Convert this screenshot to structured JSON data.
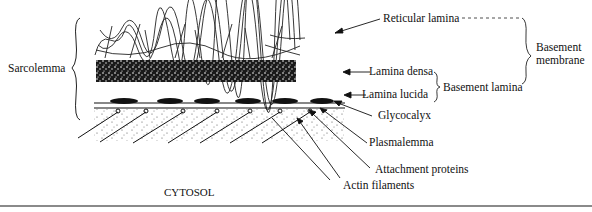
{
  "diagram": {
    "title": "",
    "left_brace_label": "Sarcolemma",
    "layers": [
      {
        "id": "reticular",
        "label": "Reticular lamina"
      },
      {
        "id": "densa",
        "label": "Lamina densa"
      },
      {
        "id": "lucida",
        "label": "Lamina lucida"
      },
      {
        "id": "glycocalyx",
        "label": "Glycocalyx"
      },
      {
        "id": "plasmalemma",
        "label": "Plasmalemma"
      },
      {
        "id": "attachment",
        "label": "Attachment proteins"
      },
      {
        "id": "actin",
        "label": "Actin filaments"
      }
    ],
    "groups": {
      "basement_lamina": "Basement lamina",
      "basement_membrane_line1": "Basement",
      "basement_membrane_line2": "membrane"
    },
    "region_label": "CYTOSOL"
  }
}
